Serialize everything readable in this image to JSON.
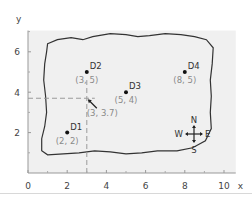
{
  "chart_data": {
    "type": "scatter",
    "title": "",
    "xlabel": "x",
    "ylabel": "y",
    "xlim": [
      0,
      10.6
    ],
    "ylim": [
      0,
      7.2
    ],
    "xticks": [
      0,
      2,
      4,
      6,
      8,
      10
    ],
    "yticks": [
      2,
      4,
      6
    ],
    "xtick_labels": [
      "0",
      "2",
      "4",
      "6",
      "8",
      "10"
    ],
    "ytick_labels": [
      "2",
      "4",
      "6"
    ],
    "minor_xticks": [
      1,
      3,
      5,
      7,
      9
    ],
    "minor_yticks": [
      1,
      3,
      5,
      7
    ],
    "grid": false,
    "background": "#f0f0f0",
    "points": [
      {
        "name": "D1",
        "x": 2,
        "y": 2,
        "coord_label": "(2, 2)"
      },
      {
        "name": "D2",
        "x": 3,
        "y": 5,
        "coord_label": "(3, 5)"
      },
      {
        "name": "D3",
        "x": 5,
        "y": 4,
        "coord_label": "(5, 4)"
      },
      {
        "name": "D4",
        "x": 8,
        "y": 5,
        "coord_label": "(8, 5)"
      }
    ],
    "reference_point": {
      "x": 3,
      "y": 3.7,
      "label": "(3, 3.7)",
      "style": "dashed guide lines with arrow"
    },
    "boundary": "irregular closed outline around the region",
    "compass": {
      "N": "N",
      "S": "S",
      "E": "E",
      "W": "W",
      "position": "bottom-right"
    },
    "colors": {
      "point": "#111111",
      "coord_text": "#8a8a8a",
      "dashed": "#9a9a9a",
      "outline": "#333333"
    }
  }
}
